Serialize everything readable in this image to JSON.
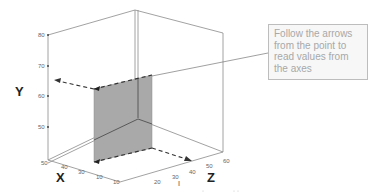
{
  "diagram": {
    "type": "3d-axes-readout-illustration",
    "axes": {
      "x": {
        "label": "X",
        "ticks": [
          "50",
          "40",
          "30",
          "10",
          "10"
        ]
      },
      "y": {
        "label": "Y",
        "ticks": [
          "80",
          "70",
          "60",
          "50"
        ]
      },
      "z": {
        "label": "Z",
        "ticks": [
          "20",
          "30",
          "40",
          "50",
          "60"
        ]
      }
    },
    "small_marker": "I",
    "callout": {
      "text": "Follow the arrows from the point to read values from the axes"
    },
    "colors": {
      "plane_fill": "#a9a9a9",
      "axis_line": "#555555",
      "box_line": "#8a8a8a",
      "callout_text": "#a8a8a8",
      "callout_border": "#bdbdbd"
    }
  }
}
